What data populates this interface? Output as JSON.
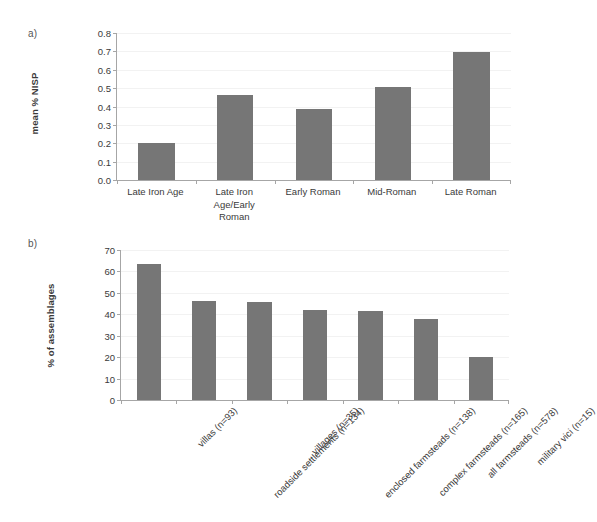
{
  "figure": {
    "panel_a_letter": "a)",
    "panel_b_letter": "b)",
    "bar_color": "#767676",
    "axis_color": "#a6a6a6",
    "grid_color": "#f2f2f2"
  },
  "chart_data": [
    {
      "type": "bar",
      "panel": "a)",
      "title": "",
      "xlabel": "",
      "ylabel": "mean % NISP",
      "ylim": [
        0.0,
        0.8
      ],
      "ytick_step": 0.1,
      "ytick_labels": [
        "0.8",
        "0.7",
        "0.6",
        "0.5",
        "0.4",
        "0.3",
        "0.2",
        "0.1",
        "0.0"
      ],
      "ytick_values": [
        0.8,
        0.7,
        0.6,
        0.5,
        0.4,
        0.3,
        0.2,
        0.1,
        0.0
      ],
      "grid": true,
      "legend": "none",
      "categories": [
        "Late Iron Age",
        "Late Iron Age/Early Roman",
        "Early Roman",
        "Mid-Roman",
        "Late Roman"
      ],
      "category_labels_display": [
        "Late Iron Age",
        "Late Iron\nAge/Early\nRoman",
        "Early Roman",
        "Mid-Roman",
        "Late Roman"
      ],
      "values": [
        0.2,
        0.465,
        0.385,
        0.505,
        0.695
      ]
    },
    {
      "type": "bar",
      "panel": "b)",
      "title": "",
      "xlabel": "",
      "ylabel": "% of assemblages",
      "ylim": [
        0,
        70
      ],
      "ytick_step": 10,
      "ytick_labels": [
        "70",
        "60",
        "50",
        "40",
        "30",
        "20",
        "10",
        "0"
      ],
      "ytick_values": [
        70,
        60,
        50,
        40,
        30,
        20,
        10,
        0
      ],
      "grid": true,
      "legend": "none",
      "categories": [
        "villas (n=93)",
        "roadside settlements (n=134)",
        "villages (n=35)",
        "enclosed farmsteads (n=138)",
        "complex farmsteads (n=165)",
        "all farmsteads (n=578)",
        "military vici (n=15)"
      ],
      "values": [
        63.5,
        46.2,
        45.6,
        41.8,
        41.6,
        38.0,
        20.0
      ]
    }
  ]
}
